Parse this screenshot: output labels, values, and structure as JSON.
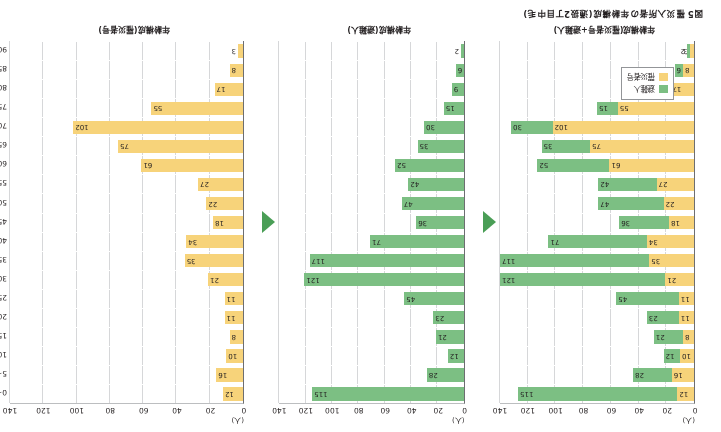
{
  "figure": {
    "title": "図5 罹災入所者の年齢構成(通扱2丁目中毛)",
    "unit_label": "(人)"
  },
  "panels": {
    "left": {
      "caption": "年齢構成(罹災者号+避難人)"
    },
    "mid": {
      "caption": "年齢構成(避難人)"
    },
    "right": {
      "caption": "年齢構成(罹災者号)"
    }
  },
  "legend": {
    "evacuees_label": "避難人",
    "victims_label": "罹災者号",
    "evacuees_color": "#7cbf83",
    "victims_color": "#f7d37a"
  },
  "arrows": {
    "glyph": "left-triangle",
    "color": "#4a9e56"
  },
  "chart_data": {
    "type": "bar",
    "title": "図5 罹災入所者の年齢構成(通扱2丁目中毛)",
    "xlabel": "(人)",
    "ylabel": "",
    "xlim": [
      0,
      140
    ],
    "xticks": [
      0,
      20,
      40,
      60,
      80,
      100,
      120,
      140
    ],
    "grid": true,
    "orientation": "horizontal",
    "legend_position": "bottom-left",
    "categories": [
      "0~4歳",
      "5~9歳",
      "10~14歳",
      "15~19歳",
      "20~24歳",
      "25~29歳",
      "30~34歳",
      "35~39歳",
      "40~44歳",
      "45~49歳",
      "50~54歳",
      "55~59歳",
      "60~64歳",
      "65~69歳",
      "70~74歳",
      "75~79歳",
      "80~84歳",
      "85~89歳",
      "90~94歳"
    ],
    "series": [
      {
        "name": "罹災者号",
        "color": "#f7d37a",
        "values": [
          12,
          16,
          10,
          8,
          11,
          11,
          21,
          35,
          34,
          18,
          22,
          27,
          61,
          75,
          102,
          55,
          17,
          8,
          3
        ]
      },
      {
        "name": "避難人",
        "color": "#7cbf83",
        "values": [
          115,
          28,
          12,
          21,
          23,
          45,
          121,
          117,
          71,
          36,
          47,
          42,
          52,
          35,
          30,
          15,
          9,
          6,
          2
        ]
      }
    ],
    "stacked_panel": {
      "name": "年齢構成(罹災者号+避難人)",
      "stacked": true,
      "totals": [
        127,
        44,
        22,
        29,
        34,
        56,
        142,
        152,
        105,
        54,
        69,
        69,
        113,
        110,
        132,
        70,
        26,
        14,
        5
      ]
    }
  }
}
